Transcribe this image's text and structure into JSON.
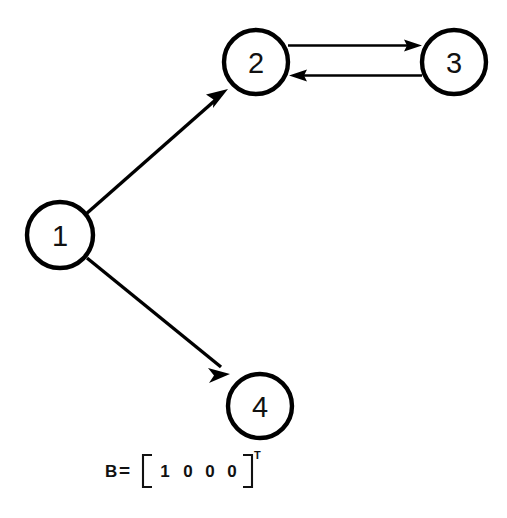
{
  "figure": {
    "background_color": "#ffffff",
    "ink_color": "#000000",
    "type": "directed-graph"
  },
  "graph": {
    "nodes": [
      {
        "id": "1",
        "label": "1",
        "cx": 60,
        "cy": 235,
        "r": 33
      },
      {
        "id": "2",
        "label": "2",
        "cx": 256,
        "cy": 62,
        "r": 32
      },
      {
        "id": "3",
        "label": "3",
        "cx": 454,
        "cy": 62,
        "r": 32
      },
      {
        "id": "4",
        "label": "4",
        "cx": 260,
        "cy": 406,
        "r": 32
      }
    ],
    "edges": [
      {
        "id": "e-1-2",
        "from": "1",
        "to": "2",
        "style": "straight-diagonal",
        "directed": true
      },
      {
        "id": "e-1-4",
        "from": "1",
        "to": "4",
        "style": "straight-diagonal",
        "directed": true
      },
      {
        "id": "e-2-3",
        "from": "2",
        "to": "3",
        "style": "horizontal-upper",
        "directed": true
      },
      {
        "id": "e-3-2",
        "from": "3",
        "to": "2",
        "style": "horizontal-lower",
        "directed": true
      }
    ]
  },
  "formula": {
    "matrix_name": "B",
    "equals": "=",
    "entries": [
      "1",
      "0",
      "0",
      "0"
    ],
    "superscript": "T",
    "rendered": "B = [1 0 0 0]T"
  }
}
